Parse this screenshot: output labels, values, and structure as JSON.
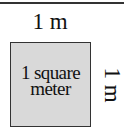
{
  "diagram": {
    "top_label": "1 m",
    "side_label": "1 m",
    "square_lines": [
      "1 square",
      "meter"
    ],
    "colors": {
      "square_fill": "#d9d9d9",
      "border": "#333333",
      "text": "#111111"
    }
  }
}
